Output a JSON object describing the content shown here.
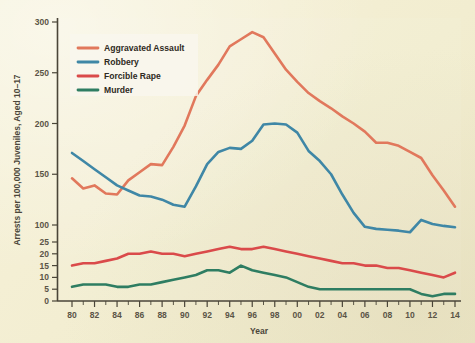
{
  "chart_data": {
    "type": "line",
    "title": "",
    "xlabel": "Year",
    "ylabel": "Arrests per 100,000 Juveniles, Aged 10–17",
    "x": [
      1980,
      1981,
      1982,
      1983,
      1984,
      1985,
      1986,
      1987,
      1988,
      1989,
      1990,
      1991,
      1992,
      1993,
      1994,
      1995,
      1996,
      1997,
      1998,
      1999,
      2000,
      2001,
      2002,
      2003,
      2004,
      2005,
      2006,
      2007,
      2008,
      2009,
      2010,
      2011,
      2012,
      2013,
      2014
    ],
    "xtick_labels": [
      "80",
      "82",
      "84",
      "86",
      "88",
      "90",
      "92",
      "94",
      "96",
      "98",
      "00",
      "02",
      "04",
      "06",
      "08",
      "10",
      "12",
      "14"
    ],
    "xtick_values": [
      1980,
      1982,
      1984,
      1986,
      1988,
      1990,
      1992,
      1994,
      1996,
      1998,
      2000,
      2002,
      2004,
      2006,
      2008,
      2010,
      2012,
      2014
    ],
    "xlim": [
      1980,
      2014
    ],
    "ytick_labels": [
      "0",
      "5",
      "10",
      "15",
      "20",
      "25",
      "100",
      "150",
      "200",
      "250",
      "300"
    ],
    "ytick_values": [
      0,
      5,
      10,
      15,
      20,
      25,
      100,
      150,
      200,
      250,
      300
    ],
    "y_axis_note": "broken axis: 0-25 lower band then 100-300 upper band",
    "ylim": [
      0,
      300
    ],
    "grid": false,
    "legend_position": "upper-left",
    "series": [
      {
        "name": "Aggravated Assault",
        "color": "#e1785c",
        "values": [
          146,
          136,
          139,
          131,
          130,
          144,
          152,
          160,
          159,
          177,
          198,
          227,
          243,
          258,
          276,
          283,
          290,
          285,
          269,
          253,
          241,
          230,
          222,
          215,
          207,
          200,
          192,
          181,
          181,
          178,
          172,
          166,
          149,
          134,
          118
        ]
      },
      {
        "name": "Robbery",
        "color": "#3f87a6",
        "values": [
          171,
          163,
          155,
          147,
          139,
          134,
          129,
          128,
          125,
          120,
          118,
          138,
          160,
          172,
          176,
          175,
          183,
          199,
          200,
          199,
          191,
          173,
          163,
          150,
          130,
          112,
          92,
          83,
          79,
          75,
          68,
          105,
          101,
          96,
          90
        ]
      },
      {
        "name": "Forcible Rape",
        "color": "#da4a4a",
        "values": [
          15,
          16,
          16,
          17,
          18,
          20,
          20,
          21,
          20,
          20,
          19,
          20,
          21,
          22,
          23,
          22,
          22,
          23,
          22,
          21,
          20,
          19,
          18,
          17,
          16,
          16,
          15,
          15,
          14,
          14,
          13,
          12,
          11,
          10,
          12
        ]
      },
      {
        "name": "Murder",
        "color": "#2e7d62",
        "values": [
          6,
          7,
          7,
          7,
          6,
          6,
          7,
          7,
          8,
          9,
          10,
          11,
          13,
          13,
          12,
          15,
          13,
          12,
          11,
          10,
          8,
          6,
          5,
          5,
          5,
          5,
          5,
          5,
          5,
          5,
          5,
          3,
          2,
          3,
          3
        ]
      }
    ]
  },
  "legend": {
    "items": [
      {
        "label": "Aggravated Assault",
        "color": "#e1785c"
      },
      {
        "label": "Robbery",
        "color": "#3f87a6"
      },
      {
        "label": "Forcible Rape",
        "color": "#da4a4a"
      },
      {
        "label": "Murder",
        "color": "#2e7d62"
      }
    ]
  },
  "axes": {
    "x_title": "Year",
    "y_title": "Arrests per 100,000 Juveniles, Aged 10–17",
    "ytick_labels": [
      "300",
      "250",
      "200",
      "150",
      "100",
      "25",
      "20",
      "15",
      "10",
      "5",
      "0"
    ],
    "xtick_labels": [
      "80",
      "82",
      "84",
      "86",
      "88",
      "90",
      "92",
      "94",
      "96",
      "98",
      "00",
      "02",
      "04",
      "06",
      "08",
      "10",
      "12",
      "14"
    ]
  },
  "colors": {
    "background": "#f3eed5",
    "axis": "#4a4538",
    "assault": "#e1785c",
    "robbery": "#3f87a6",
    "rape": "#da4a4a",
    "murder": "#2e7d62",
    "legend_bg": "#f8f6ec"
  }
}
